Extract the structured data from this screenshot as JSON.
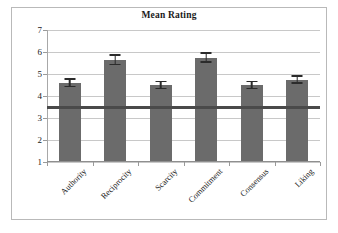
{
  "chart_data": {
    "type": "bar",
    "title": "Mean Rating",
    "xlabel": "",
    "ylabel": "",
    "categories": [
      "Authority",
      "Reciprocity",
      "Scarcity",
      "Commitment",
      "Consensus",
      "Liking"
    ],
    "values": [
      4.6,
      5.65,
      4.5,
      5.75,
      4.5,
      4.75
    ],
    "errors": [
      0.2,
      0.25,
      0.2,
      0.25,
      0.2,
      0.2
    ],
    "series": [
      {
        "name": "Mean Rating",
        "values": [
          4.6,
          5.65,
          4.5,
          5.75,
          4.5,
          4.75
        ],
        "errors": [
          0.2,
          0.25,
          0.2,
          0.25,
          0.2,
          0.2
        ]
      }
    ],
    "ylim": [
      1,
      7
    ],
    "yticks": [
      1,
      2,
      3,
      4,
      5,
      6,
      7
    ],
    "ytick_labels": [
      "1",
      "2",
      "3",
      "4",
      "5",
      "6",
      "7"
    ],
    "grid": true,
    "legend": false,
    "legend_position": "none",
    "annotations": [
      {
        "name": "midpoint-reference-line",
        "type": "hline",
        "value": 3.5,
        "color": "#4a4a4a"
      }
    ],
    "colors": {
      "bar": "#6b6b6b",
      "error_bar": "#2b2b2b",
      "gridline": "#c8c8c8",
      "reference_line": "#4a4a4a",
      "frame": "#b9b9b9",
      "background": "#ffffff",
      "text": "#1a1a1a"
    }
  }
}
